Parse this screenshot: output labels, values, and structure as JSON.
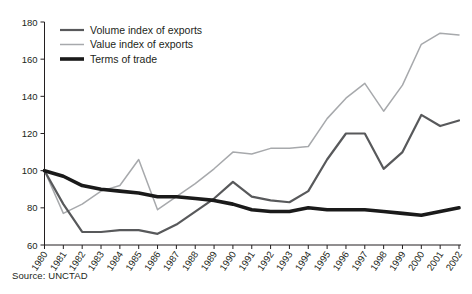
{
  "source": {
    "label": "Source: UNCTAD"
  },
  "legend": {
    "position": "top-left-inside",
    "entries": [
      {
        "name": "volume-index-of-exports",
        "label": "Volume index of exports",
        "color": "#58595b",
        "width": 2.2
      },
      {
        "name": "value-index-of-exports",
        "label": "Value index of exports",
        "color": "#a7a9ac",
        "width": 1.5
      },
      {
        "name": "terms-of-trade",
        "label": "Terms of trade",
        "color": "#1a1a1a",
        "width": 3.6
      }
    ]
  },
  "chart_data": {
    "type": "line",
    "title": "",
    "subtitle": "",
    "xlabel": "",
    "ylabel": "",
    "xlim": [
      1980,
      2002
    ],
    "ylim": [
      60,
      180
    ],
    "yticks": [
      60,
      80,
      100,
      120,
      140,
      160,
      180
    ],
    "grid": false,
    "legend_position": "upper left",
    "annotations": [
      "Source: UNCTAD"
    ],
    "categories": [
      "1980",
      "1981",
      "1982",
      "1983",
      "1984",
      "1985",
      "1986",
      "1987",
      "1988",
      "1989",
      "1990",
      "1991",
      "1992",
      "1993",
      "1994",
      "1995",
      "1996",
      "1997",
      "1998",
      "1999",
      "2000",
      "2001",
      "2002"
    ],
    "x": [
      1980,
      1981,
      1982,
      1983,
      1984,
      1985,
      1986,
      1987,
      1988,
      1989,
      1990,
      1991,
      1992,
      1993,
      1994,
      1995,
      1996,
      1997,
      1998,
      1999,
      2000,
      2001,
      2002
    ],
    "series": [
      {
        "name": "Volume index of exports",
        "color": "#58595b",
        "values": [
          100,
          82,
          67,
          67,
          68,
          68,
          66,
          71,
          78,
          85,
          94,
          86,
          84,
          83,
          89,
          106,
          120,
          120,
          101,
          110,
          130,
          124,
          127
        ]
      },
      {
        "name": "Value index of exports",
        "color": "#a7a9ac",
        "values": [
          100,
          77,
          82,
          89,
          92,
          106,
          79,
          86,
          93,
          101,
          110,
          109,
          112,
          112,
          113,
          128,
          139,
          147,
          132,
          146,
          168,
          174,
          173
        ]
      },
      {
        "name": "Terms of trade",
        "color": "#1a1a1a",
        "values": [
          100,
          97,
          92,
          90,
          89,
          88,
          86,
          86,
          85,
          84,
          82,
          79,
          78,
          78,
          80,
          79,
          79,
          79,
          78,
          77,
          76,
          78,
          80
        ]
      }
    ]
  },
  "axes": {
    "x_axis_name": "year-axis",
    "y_axis_name": "index-axis"
  }
}
